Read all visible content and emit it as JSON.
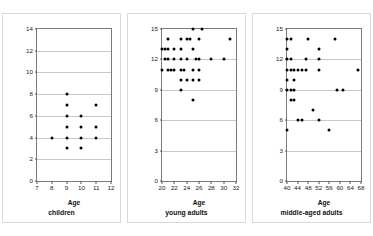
{
  "figure": {
    "background_color": "#ffffff",
    "panel_border_color": "#d9d9d9",
    "axis_color": "#7a7a7a",
    "grid_color": "#c8c8c8",
    "marker_color": "#000000"
  },
  "chart_data": [
    {
      "type": "scatter",
      "title": "children",
      "xlabel": "Age",
      "ylabel": "verbal memory [max = 14]",
      "xlim": [
        7,
        12
      ],
      "ylim": [
        0,
        14
      ],
      "xticks": [
        7,
        8,
        9,
        10,
        11,
        12
      ],
      "yticks": [
        0,
        2,
        4,
        6,
        8,
        10,
        12,
        14
      ],
      "grid": true,
      "legend": "none",
      "points": [
        {
          "x": 8,
          "y": 4
        },
        {
          "x": 9,
          "y": 3
        },
        {
          "x": 9,
          "y": 4
        },
        {
          "x": 9,
          "y": 5
        },
        {
          "x": 9,
          "y": 6
        },
        {
          "x": 9,
          "y": 7
        },
        {
          "x": 9,
          "y": 8
        },
        {
          "x": 10,
          "y": 3
        },
        {
          "x": 10,
          "y": 4
        },
        {
          "x": 10,
          "y": 5
        },
        {
          "x": 10,
          "y": 6
        },
        {
          "x": 11,
          "y": 4
        },
        {
          "x": 11,
          "y": 5
        },
        {
          "x": 11,
          "y": 7
        }
      ]
    },
    {
      "type": "scatter",
      "title": "young adults",
      "xlabel": "Age",
      "ylabel": "verbal memory [max = 15]",
      "xlim": [
        20,
        32
      ],
      "ylim": [
        0,
        15
      ],
      "xticks": [
        20,
        22,
        24,
        26,
        28,
        30,
        32
      ],
      "yticks": [
        0,
        3,
        6,
        9,
        12,
        15
      ],
      "grid": true,
      "legend": "none",
      "points": [
        {
          "x": 20,
          "y": 11
        },
        {
          "x": 20,
          "y": 13
        },
        {
          "x": 20.5,
          "y": 12
        },
        {
          "x": 20.5,
          "y": 13
        },
        {
          "x": 21,
          "y": 12
        },
        {
          "x": 21,
          "y": 13
        },
        {
          "x": 21,
          "y": 14
        },
        {
          "x": 21,
          "y": 11
        },
        {
          "x": 21.5,
          "y": 11
        },
        {
          "x": 22,
          "y": 11
        },
        {
          "x": 22,
          "y": 12
        },
        {
          "x": 22,
          "y": 13
        },
        {
          "x": 23,
          "y": 9
        },
        {
          "x": 23,
          "y": 10
        },
        {
          "x": 23,
          "y": 11
        },
        {
          "x": 23,
          "y": 12
        },
        {
          "x": 23,
          "y": 13
        },
        {
          "x": 23,
          "y": 14
        },
        {
          "x": 23.5,
          "y": 11
        },
        {
          "x": 24,
          "y": 10
        },
        {
          "x": 24,
          "y": 12
        },
        {
          "x": 24,
          "y": 14
        },
        {
          "x": 24.5,
          "y": 14
        },
        {
          "x": 25,
          "y": 10
        },
        {
          "x": 25,
          "y": 11
        },
        {
          "x": 25,
          "y": 13
        },
        {
          "x": 25,
          "y": 15
        },
        {
          "x": 25,
          "y": 8
        },
        {
          "x": 25.5,
          "y": 12
        },
        {
          "x": 26,
          "y": 10
        },
        {
          "x": 26,
          "y": 11
        },
        {
          "x": 26,
          "y": 12
        },
        {
          "x": 26,
          "y": 14
        },
        {
          "x": 26.5,
          "y": 15
        },
        {
          "x": 28,
          "y": 12
        },
        {
          "x": 30,
          "y": 12
        },
        {
          "x": 31,
          "y": 14
        }
      ]
    },
    {
      "type": "scatter",
      "title": "middle-aged adults",
      "xlabel": "Age",
      "ylabel": "verbal memory [max = 15]",
      "xlim": [
        40,
        68
      ],
      "ylim": [
        0,
        15
      ],
      "xticks": [
        40,
        44,
        48,
        52,
        56,
        60,
        64,
        68
      ],
      "yticks": [
        0,
        3,
        6,
        9,
        12,
        15
      ],
      "grid": true,
      "legend": "none",
      "points": [
        {
          "x": 40,
          "y": 14
        },
        {
          "x": 40,
          "y": 13
        },
        {
          "x": 40,
          "y": 12
        },
        {
          "x": 40,
          "y": 11
        },
        {
          "x": 40,
          "y": 10
        },
        {
          "x": 40,
          "y": 9
        },
        {
          "x": 40,
          "y": 5
        },
        {
          "x": 41.5,
          "y": 14
        },
        {
          "x": 41.5,
          "y": 12
        },
        {
          "x": 41.5,
          "y": 11
        },
        {
          "x": 41.5,
          "y": 9
        },
        {
          "x": 41.5,
          "y": 8
        },
        {
          "x": 42.5,
          "y": 11
        },
        {
          "x": 42.5,
          "y": 10
        },
        {
          "x": 42.5,
          "y": 8
        },
        {
          "x": 42.5,
          "y": 9
        },
        {
          "x": 44,
          "y": 11
        },
        {
          "x": 44,
          "y": 6
        },
        {
          "x": 45.5,
          "y": 11
        },
        {
          "x": 45.5,
          "y": 6
        },
        {
          "x": 47,
          "y": 12
        },
        {
          "x": 47,
          "y": 11
        },
        {
          "x": 48,
          "y": 14
        },
        {
          "x": 50,
          "y": 7
        },
        {
          "x": 52,
          "y": 12
        },
        {
          "x": 52,
          "y": 11
        },
        {
          "x": 52,
          "y": 13
        },
        {
          "x": 52,
          "y": 6
        },
        {
          "x": 56,
          "y": 5
        },
        {
          "x": 58,
          "y": 14
        },
        {
          "x": 59,
          "y": 9
        },
        {
          "x": 61,
          "y": 9
        },
        {
          "x": 67,
          "y": 11
        }
      ]
    }
  ]
}
